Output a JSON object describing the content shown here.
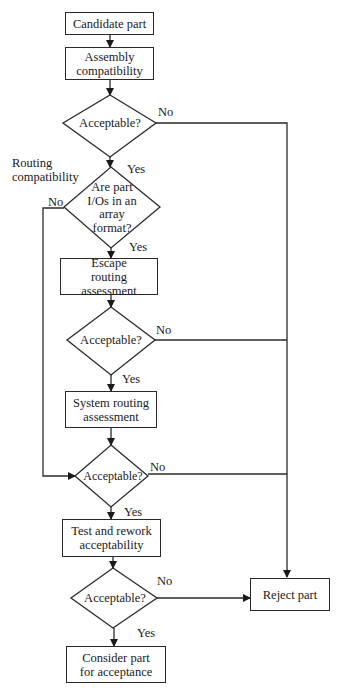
{
  "diagram": {
    "type": "flowchart",
    "nodes": {
      "candidate": "Candidate part",
      "assembly": "Assembly compatibility",
      "decision1": "Acceptable?",
      "routing_label": "Routing compatibility",
      "decision2": "Are part I/Os in an array format?",
      "escape": "Escape routing assessment",
      "decision3": "Acceptable?",
      "system": "System routing assessment",
      "decision4": "Acceptable?",
      "test": "Test and rework acceptability",
      "decision5": "Acceptable?",
      "reject": "Reject part",
      "consider": "Consider part for acceptance"
    },
    "labels": {
      "yes": "Yes",
      "no": "No"
    },
    "edges": [
      {
        "from": "candidate",
        "to": "assembly"
      },
      {
        "from": "assembly",
        "to": "decision1"
      },
      {
        "from": "decision1",
        "to": "decision2",
        "label": "Yes"
      },
      {
        "from": "decision1",
        "to": "reject",
        "label": "No"
      },
      {
        "from": "decision2",
        "to": "escape",
        "label": "Yes"
      },
      {
        "from": "decision2",
        "to": "decision4",
        "label": "No"
      },
      {
        "from": "escape",
        "to": "decision3"
      },
      {
        "from": "decision3",
        "to": "system",
        "label": "Yes"
      },
      {
        "from": "decision3",
        "to": "reject",
        "label": "No"
      },
      {
        "from": "system",
        "to": "decision4"
      },
      {
        "from": "decision4",
        "to": "test",
        "label": "Yes"
      },
      {
        "from": "decision4",
        "to": "reject",
        "label": "No"
      },
      {
        "from": "test",
        "to": "decision5"
      },
      {
        "from": "decision5",
        "to": "consider",
        "label": "Yes"
      },
      {
        "from": "decision5",
        "to": "reject",
        "label": "No"
      }
    ]
  }
}
